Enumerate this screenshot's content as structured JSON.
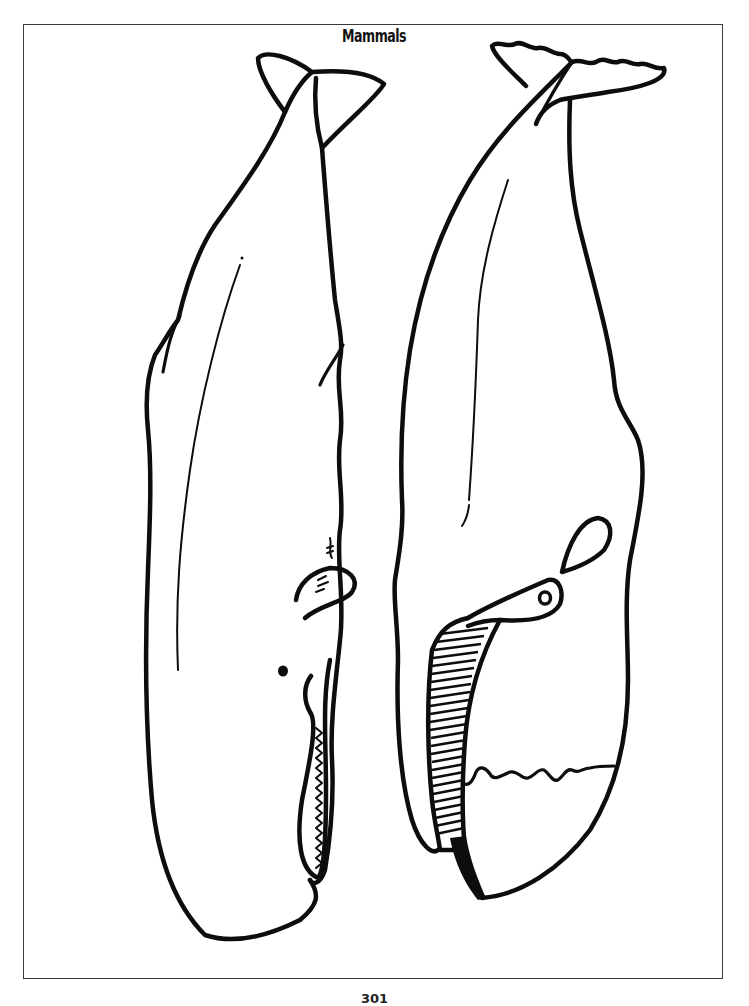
{
  "page": {
    "title": "Mammals",
    "page_number": "301",
    "background_color": "#ffffff",
    "ink_color": "#0d0d0d"
  },
  "illustration": {
    "type": "coloring-page line art",
    "subjects": [
      {
        "name": "sperm-whale",
        "position": "left",
        "features": [
          "tail-fluke",
          "pectoral-fin",
          "eye",
          "toothed-lower-jaw",
          "blowhole-wrinkles"
        ]
      },
      {
        "name": "baleen-whale",
        "position": "right",
        "features": [
          "scalloped-tail-fluke",
          "pectoral-fin",
          "eye",
          "baleen-plates",
          "wavy-belly-line"
        ]
      }
    ]
  }
}
